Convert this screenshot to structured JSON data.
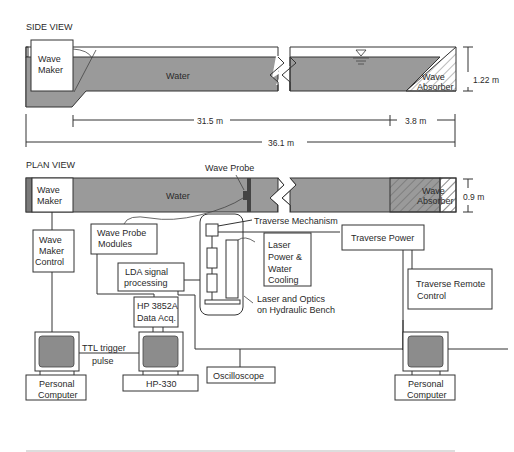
{
  "side_view": {
    "title": "SIDE VIEW",
    "wave_maker": [
      "Wave",
      "Maker"
    ],
    "water": "Water",
    "wave_absorber": [
      "Wave",
      "Absorber"
    ],
    "height": "1.22 m",
    "dim_main": "31.5 m",
    "dim_absorber": "3.8 m",
    "dim_total": "36.1 m"
  },
  "plan_view": {
    "title": "PLAN VIEW",
    "wave_maker": [
      "Wave",
      "Maker"
    ],
    "water": "Water",
    "wave_probe": "Wave Probe",
    "wave_absorber": [
      "Wave",
      "Absorber"
    ],
    "width": "0.9 m"
  },
  "components": {
    "wave_maker_control": [
      "Wave",
      "Maker",
      "Control"
    ],
    "wave_probe_modules": [
      "Wave Probe",
      "Modules"
    ],
    "traverse_mechanism": "Traverse Mechanism",
    "laser_power": [
      "Laser",
      "Power &",
      "Water",
      "Cooling"
    ],
    "traverse_power": "Traverse Power",
    "traverse_remote": [
      "Traverse Remote",
      "Control"
    ],
    "lda_signal": [
      "LDA signal",
      "processing"
    ],
    "laser_optics": [
      "Laser and Optics",
      "on Hydraulic Bench"
    ],
    "hp_data_acq": [
      "HP 3852A",
      "Data Acq."
    ],
    "ttl_trigger": [
      "TTL trigger",
      "pulse"
    ],
    "pc_left": [
      "Personal",
      "Computer"
    ],
    "hp330": "HP-330",
    "oscilloscope": "Oscilloscope",
    "pc_right": [
      "Personal",
      "Computer"
    ]
  }
}
